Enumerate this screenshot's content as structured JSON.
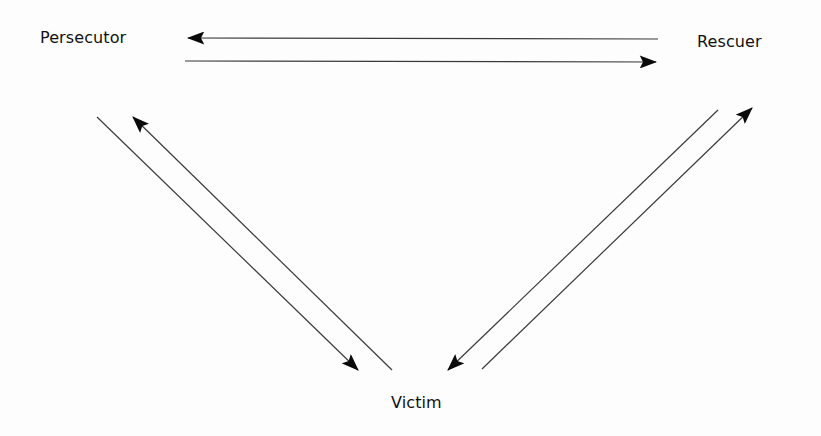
{
  "diagram": {
    "nodes": {
      "persecutor": "Persecutor",
      "rescuer": "Rescuer",
      "victim": "Victim"
    },
    "edges": [
      {
        "from": "Rescuer",
        "to": "Persecutor"
      },
      {
        "from": "Persecutor",
        "to": "Rescuer"
      },
      {
        "from": "Persecutor",
        "to": "Victim"
      },
      {
        "from": "Victim",
        "to": "Persecutor"
      },
      {
        "from": "Rescuer",
        "to": "Victim"
      },
      {
        "from": "Victim",
        "to": "Rescuer"
      }
    ],
    "colors": {
      "line": "#3a3a3a",
      "arrowhead": "#0a0a0a",
      "text": "#111111",
      "background": "#fdfdfd"
    }
  }
}
